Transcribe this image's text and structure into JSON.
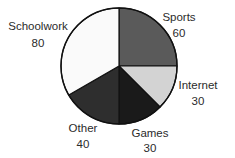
{
  "chart_data": {
    "type": "pie",
    "title": "",
    "start_angle_deg": 0,
    "direction": "clockwise",
    "total": 240,
    "slices": [
      {
        "label": "Sports",
        "value": 60,
        "color": "#5a5a5a"
      },
      {
        "label": "Internet",
        "value": 30,
        "color": "#d3d3d3"
      },
      {
        "label": "Games",
        "value": 30,
        "color": "#1a1a1a"
      },
      {
        "label": "Other",
        "value": 40,
        "color": "#2e2e2e"
      },
      {
        "label": "Schoolwork",
        "value": 80,
        "color": "#fafafa"
      }
    ],
    "categories": [
      "Sports",
      "Internet",
      "Games",
      "Other",
      "Schoolwork"
    ],
    "values": [
      60,
      30,
      30,
      40,
      80
    ],
    "legend": "none (labels placed beside slices)"
  },
  "labels": {
    "sports": {
      "name": "Sports",
      "value": "60"
    },
    "internet": {
      "name": "Internet",
      "value": "30"
    },
    "games": {
      "name": "Games",
      "value": "30"
    },
    "other": {
      "name": "Other",
      "value": "40"
    },
    "schoolwork": {
      "name": "Schoolwork",
      "value": "80"
    }
  }
}
